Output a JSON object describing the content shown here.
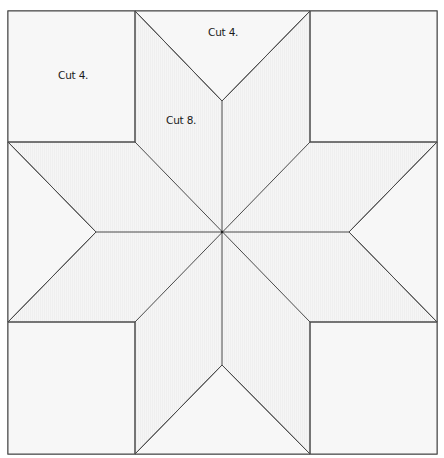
{
  "diagram": {
    "colors": {
      "background": "#ffffff",
      "fill": "#f4f4f4",
      "line": "#4a4a4a",
      "text": "#1a1a1a"
    },
    "labels": {
      "corner_square": "Cut 4.",
      "side_triangle": "Cut 4.",
      "diamond": "Cut 8."
    },
    "geometry": {
      "outer": {
        "x1": 8,
        "y1": 11,
        "x2": 437,
        "y2": 454
      },
      "center": [
        222,
        232
      ],
      "inner_x": [
        135,
        310
      ],
      "inner_y": [
        142,
        322
      ],
      "tips": {
        "top": [
          222,
          101
        ],
        "bottom": [
          222,
          365
        ],
        "left": [
          96,
          232
        ],
        "right": [
          349,
          232
        ]
      }
    },
    "pieces": [
      {
        "type": "square",
        "position": "top-left",
        "label": "Cut 4."
      },
      {
        "type": "square",
        "position": "top-right"
      },
      {
        "type": "square",
        "position": "bottom-left"
      },
      {
        "type": "square",
        "position": "bottom-right"
      },
      {
        "type": "triangle",
        "position": "top",
        "label": "Cut 4."
      },
      {
        "type": "triangle",
        "position": "left"
      },
      {
        "type": "triangle",
        "position": "right"
      },
      {
        "type": "triangle",
        "position": "bottom"
      },
      {
        "type": "diamond",
        "count": 8,
        "label": "Cut 8."
      }
    ]
  }
}
